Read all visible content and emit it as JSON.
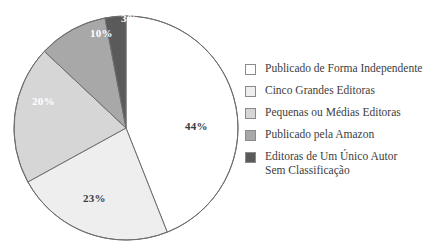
{
  "chart_data": {
    "type": "pie",
    "title": "",
    "categories": [
      "Publicado de Forma Independente",
      "Cinco Grandes Editoras",
      "Pequenas ou Médias Editoras",
      "Publicado pela Amazon",
      "Editoras de Um Único Autor\nSem Classificação"
    ],
    "values": [
      44,
      23,
      20,
      10,
      3
    ],
    "value_labels": [
      "44%",
      "23%",
      "20%",
      "10%",
      "3%"
    ],
    "colors": [
      "#ffffff",
      "#eeeeee",
      "#d6d6d6",
      "#a8a8a8",
      "#5a5a5a"
    ],
    "label_text_colors": [
      "#3a3a3a",
      "#3a3a3a",
      "#ffffff",
      "#ffffff",
      "#ffffff"
    ],
    "legend_position": "right",
    "grid": false,
    "xlabel": "",
    "ylabel": "",
    "start_angle_deg": 0,
    "direction": "clockwise",
    "outline_color": "#6e6e6e"
  },
  "slice_labels": [
    {
      "text": "44%",
      "x": 185,
      "y": 120,
      "tone": "dark-text"
    },
    {
      "text": "23%",
      "x": 83,
      "y": 192,
      "tone": "dark-text"
    },
    {
      "text": "20%",
      "x": 32,
      "y": 95,
      "tone": "light-text"
    },
    {
      "text": "10%",
      "x": 90,
      "y": 27,
      "tone": "light-text"
    },
    {
      "text": "3%",
      "x": 121,
      "y": 12,
      "tone": "light-text"
    }
  ],
  "legend": {
    "items": [
      {
        "label": "Publicado de Forma Independente",
        "color": "#ffffff"
      },
      {
        "label": "Cinco Grandes Editoras",
        "color": "#eeeeee"
      },
      {
        "label": "Pequenas ou Médias Editoras",
        "color": "#d6d6d6"
      },
      {
        "label": "Publicado pela Amazon",
        "color": "#a8a8a8"
      },
      {
        "label": "Editoras de Um Único Autor\nSem Classificação",
        "color": "#5a5a5a"
      }
    ]
  }
}
